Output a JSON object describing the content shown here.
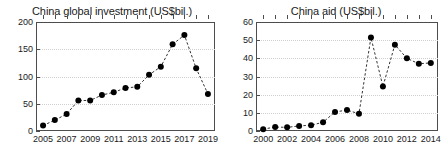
{
  "figure": {
    "background": "#ffffff",
    "axis_color": "#4d4d4d",
    "grid_color": "#cfcfcf",
    "marker_color": "#000000",
    "line_color": "#333333"
  },
  "chart_data": [
    {
      "id": "china-global-investment",
      "type": "line",
      "title": "China global investment (US$bil.)",
      "xlabel": "",
      "ylabel": "",
      "grid": true,
      "legend": "none",
      "line_style": "dashed",
      "marker": "filled-circle",
      "xlim": [
        2004.4,
        2019.6
      ],
      "ylim": [
        0,
        200
      ],
      "yticks": [
        0,
        50,
        100,
        150,
        200
      ],
      "ytick_labels": [
        "0",
        "50",
        "100",
        "150",
        "200"
      ],
      "xticks": [
        2005,
        2006,
        2007,
        2008,
        2009,
        2010,
        2011,
        2012,
        2013,
        2014,
        2015,
        2016,
        2017,
        2018,
        2019
      ],
      "xtick_labels_shown": [
        "2005",
        "2007",
        "2009",
        "2011",
        "2013",
        "2015",
        "2017",
        "2019"
      ],
      "x": [
        2005,
        2006,
        2007,
        2008,
        2009,
        2010,
        2011,
        2012,
        2013,
        2014,
        2015,
        2016,
        2017,
        2018,
        2019
      ],
      "values": [
        10,
        20,
        31,
        56,
        56,
        66,
        71,
        79,
        81,
        103,
        118,
        159,
        176,
        115,
        68
      ]
    },
    {
      "id": "china-aid",
      "type": "line",
      "title": "China aid (US$bil.)",
      "xlabel": "",
      "ylabel": "",
      "grid": true,
      "legend": "none",
      "line_style": "dashed",
      "marker": "filled-circle",
      "xlim": [
        1999.4,
        2014.6
      ],
      "ylim": [
        0,
        60
      ],
      "yticks": [
        0,
        10,
        20,
        30,
        40,
        50,
        60
      ],
      "ytick_labels": [
        "0",
        "10",
        "20",
        "30",
        "40",
        "50",
        "60"
      ],
      "xticks": [
        2000,
        2001,
        2002,
        2003,
        2004,
        2005,
        2006,
        2007,
        2008,
        2009,
        2010,
        2011,
        2012,
        2013,
        2014
      ],
      "xtick_labels_shown": [
        "2000",
        "2002",
        "2004",
        "2006",
        "2008",
        "2010",
        "2012",
        "2014"
      ],
      "x": [
        2000,
        2001,
        2002,
        2003,
        2004,
        2005,
        2006,
        2007,
        2008,
        2009,
        2010,
        2011,
        2012,
        2013,
        2014
      ],
      "values": [
        1.0,
        2.2,
        2.0,
        2.8,
        3.2,
        4.8,
        10.5,
        11.5,
        9.5,
        51.5,
        24.5,
        47.5,
        40.0,
        37.0,
        37.5
      ]
    }
  ]
}
